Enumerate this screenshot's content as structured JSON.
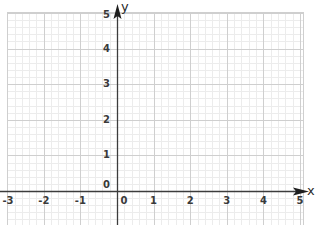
{
  "chart_data": {
    "type": "grid",
    "title": "",
    "xlabel": "x",
    "ylabel": "y",
    "x_ticks": [
      -3,
      -2,
      -1,
      0,
      1,
      2,
      3,
      4,
      5
    ],
    "y_ticks": [
      0,
      1,
      2,
      3,
      4,
      5
    ],
    "xlim": [
      -3,
      5
    ],
    "ylim": [
      -0.9,
      5
    ],
    "grid": {
      "major_step": 1,
      "minor_step": 0.2,
      "major_color": "#cfcfcf",
      "minor_color": "#ececec"
    },
    "axes_color": "#3c3c3c",
    "origin_labels": {
      "x": "0",
      "y": "0"
    },
    "series": []
  },
  "labels": {
    "x_axis_name": "x",
    "y_axis_name": "y",
    "x_tick_labels": [
      "-3",
      "-2",
      "-1",
      "0",
      "1",
      "2",
      "3",
      "4",
      "5"
    ],
    "y_tick_labels": [
      "0",
      "1",
      "2",
      "3",
      "4",
      "5"
    ]
  }
}
